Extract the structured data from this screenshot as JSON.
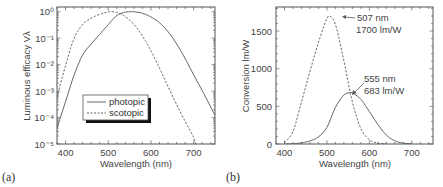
{
  "chart_data": [
    {
      "id": "a",
      "panel_label": "(a)",
      "type": "line",
      "title": "",
      "xlabel": "Wavelength (nm)",
      "ylabel": "Luminous efficacy Vλ",
      "yscale": "log",
      "xlim": [
        380,
        750
      ],
      "ylim": [
        1e-05,
        1.5
      ],
      "xticks": [
        400,
        500,
        600,
        700
      ],
      "xtick_labels": [
        "400",
        "500",
        "600",
        "700"
      ],
      "yticks": [
        0,
        -1,
        -2,
        -3,
        -4,
        -5
      ],
      "ytick_labels": [
        "10⁰",
        "10⁻¹",
        "10⁻²",
        "10⁻³",
        "10⁻⁴",
        "10⁻⁵"
      ],
      "grid": false,
      "legend": {
        "position": "lower-left-center",
        "entries": [
          "photopic",
          "scotopic"
        ]
      },
      "series": [
        {
          "name": "photopic",
          "style": "solid",
          "x": [
            380,
            400,
            420,
            440,
            460,
            480,
            500,
            520,
            540,
            555,
            560,
            580,
            600,
            620,
            640,
            660,
            680,
            700,
            720,
            750
          ],
          "values": [
            4e-05,
            0.0004,
            0.004,
            0.023,
            0.06,
            0.139,
            0.323,
            0.71,
            0.954,
            1.0,
            0.995,
            0.87,
            0.631,
            0.381,
            0.175,
            0.061,
            0.017,
            0.0041,
            0.00105,
            0.00012
          ]
        },
        {
          "name": "scotopic",
          "style": "dashed",
          "x": [
            380,
            400,
            420,
            440,
            460,
            480,
            500,
            507,
            520,
            540,
            560,
            580,
            600,
            620,
            640,
            660,
            680,
            700,
            705
          ],
          "values": [
            0.00059,
            0.0093,
            0.097,
            0.328,
            0.567,
            0.793,
            0.982,
            1.0,
            0.935,
            0.65,
            0.329,
            0.121,
            0.0332,
            0.00737,
            0.00148,
            0.000313,
            7.15e-05,
            1.78e-05,
            1e-05
          ]
        }
      ]
    },
    {
      "id": "b",
      "panel_label": "(b)",
      "type": "line",
      "title": "",
      "xlabel": "Wavelength (nm)",
      "ylabel": "Conversion  lm/W",
      "yscale": "linear",
      "xlim": [
        380,
        750
      ],
      "ylim": [
        0,
        1820
      ],
      "xticks": [
        400,
        500,
        600,
        700
      ],
      "xtick_labels": [
        "400",
        "500",
        "600",
        "700"
      ],
      "yticks": [
        0,
        500,
        1000,
        1500
      ],
      "ytick_labels": [
        "0",
        "500",
        "1000",
        "1500"
      ],
      "grid": false,
      "annotations": [
        {
          "text_line1": "507 nm",
          "text_line2": "1700 lm/W",
          "x": 507,
          "y": 1700
        },
        {
          "text_line1": "555 nm",
          "text_line2": "683 lm/W",
          "x": 555,
          "y": 683
        }
      ],
      "series": [
        {
          "name": "photopic",
          "style": "solid",
          "x": [
            400,
            420,
            440,
            460,
            480,
            500,
            520,
            540,
            555,
            560,
            580,
            600,
            620,
            640,
            660,
            680,
            700
          ],
          "values": [
            0.3,
            2.7,
            15.7,
            41,
            95,
            221,
            485,
            652,
            683,
            680,
            594,
            431,
            260,
            120,
            42,
            12,
            2.8
          ]
        },
        {
          "name": "scotopic",
          "style": "dashed",
          "x": [
            400,
            420,
            440,
            460,
            480,
            500,
            507,
            520,
            540,
            560,
            580,
            600,
            620,
            640
          ],
          "values": [
            16,
            165,
            558,
            964,
            1348,
            1669,
            1700,
            1589,
            1105,
            559,
            206,
            56,
            12.5,
            2.5
          ]
        }
      ]
    }
  ]
}
